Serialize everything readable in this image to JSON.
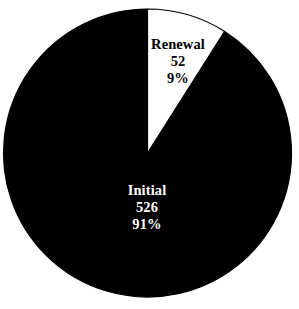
{
  "chart_data": {
    "type": "pie",
    "title": "",
    "subtitle": "",
    "xlabel": "",
    "ylabel": "",
    "legend_position": "none",
    "grid": false,
    "labels_inside": true,
    "total": 578,
    "categories": [
      "Renewal",
      "Initial"
    ],
    "values": [
      52,
      526
    ],
    "percentages": [
      9,
      91
    ],
    "slice_colors": [
      "#ffffff",
      "#000000"
    ],
    "slice_text_colors": [
      "#000000",
      "#ffffff"
    ],
    "start_angle_deg": 0,
    "direction": "clockwise",
    "slices": [
      {
        "name": "Renewal",
        "value": 52,
        "percent": 9,
        "value_text": "52",
        "percent_text": "9%",
        "fill": "#ffffff",
        "stroke": "#000000",
        "text_color": "#000000"
      },
      {
        "name": "Initial",
        "value": 526,
        "percent": 91,
        "value_text": "526",
        "percent_text": "91%",
        "fill": "#000000",
        "stroke": "#000000",
        "text_color": "#ffffff"
      }
    ]
  },
  "figure": {
    "background": "#ffffff",
    "outline_color": "#000000",
    "center_x": 147.5,
    "center_y": 153,
    "radius": 144
  }
}
